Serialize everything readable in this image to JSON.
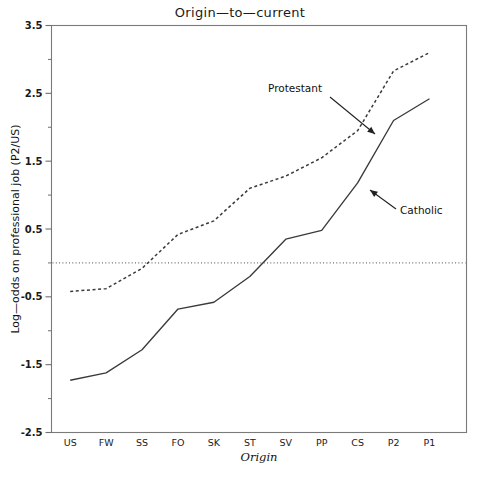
{
  "chart_data": {
    "type": "line",
    "title": "Origin—to—current",
    "xlabel": "Origin",
    "ylabel": "Log—odds on professional job (P2/US)",
    "categories": [
      "US",
      "FW",
      "SS",
      "FO",
      "SK",
      "ST",
      "SV",
      "PP",
      "CS",
      "P2",
      "P1"
    ],
    "ylim": [
      -2.5,
      3.5
    ],
    "yticks": [
      3.5,
      2.5,
      1.5,
      0.5,
      -0.5,
      -1.5,
      -2.5
    ],
    "ytick_labels": [
      "3.5",
      "2.5",
      "1.5",
      "0.5",
      "-0.5",
      "-1.5",
      "-2.5"
    ],
    "yminor_ticks": [
      3.0,
      2.0,
      1.0,
      0.0,
      -1.0,
      -2.0
    ],
    "grid": false,
    "legend_position": "inline-annotations",
    "reference_line": {
      "y": 0,
      "style": "dotted"
    },
    "series": [
      {
        "name": "Protestant",
        "style": "dotted",
        "color": "#3a3a3a",
        "values": [
          -0.42,
          -0.38,
          -0.08,
          0.42,
          0.62,
          1.1,
          1.28,
          1.55,
          1.95,
          2.83,
          3.1
        ]
      },
      {
        "name": "Catholic",
        "style": "solid",
        "color": "#3a3a3a",
        "values": [
          -1.73,
          -1.62,
          -1.28,
          -0.68,
          -0.58,
          -0.2,
          0.35,
          0.48,
          1.18,
          2.1,
          2.42
        ]
      }
    ],
    "annotations": [
      {
        "text": "Protestant",
        "label_x": 268,
        "label_y": 92,
        "arrow_from_x": 330,
        "arrow_from_y": 97,
        "arrow_to_x": 375,
        "arrow_to_y": 134
      },
      {
        "text": "Catholic",
        "label_x": 400,
        "label_y": 214,
        "arrow_from_x": 396,
        "arrow_from_y": 209,
        "arrow_to_x": 370,
        "arrow_to_y": 190
      }
    ]
  }
}
